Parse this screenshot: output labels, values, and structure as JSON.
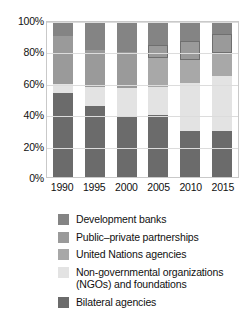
{
  "chart_data": {
    "type": "bar",
    "subtype": "stacked-percentage",
    "title": "",
    "subtitle": "",
    "xlabel": "",
    "ylabel": "",
    "categories": [
      "1990",
      "1995",
      "2000",
      "2005",
      "2010",
      "2015"
    ],
    "ylim": [
      0,
      100
    ],
    "yticks": [
      "0%",
      "20%",
      "40%",
      "60%",
      "80%",
      "100%"
    ],
    "ytick_values": [
      0,
      20,
      40,
      60,
      80,
      100
    ],
    "grid": true,
    "legend_position": "bottom",
    "stack_order_bottom_to_top": [
      "Bilateral agencies",
      "Non-governmental organizations (NGOs) and foundations",
      "United Nations agencies",
      "Public–private partnerships",
      "Development banks"
    ],
    "series": [
      {
        "name": "Bilateral agencies",
        "color": "#6b6b6b",
        "values": [
          54,
          46,
          38.5,
          40,
          29.5,
          30
        ]
      },
      {
        "name": "Non-governmental organizations (NGOs) and foundations",
        "color": "#e3e3e3",
        "values": [
          6,
          12,
          19,
          18,
          31,
          35
        ]
      },
      {
        "name": "United Nations agencies",
        "color": "#a8a8a8",
        "values": [
          0,
          0,
          0,
          19,
          15,
          15
        ]
      },
      {
        "name": "Public–private partnerships",
        "color": "#9a9a9a",
        "values": [
          31,
          24,
          23,
          8,
          12.5,
          12
        ]
      },
      {
        "name": "Development banks",
        "color": "#848484",
        "values": [
          9,
          18,
          19.5,
          15,
          12,
          8
        ]
      }
    ],
    "outlined_segments": [
      {
        "category": "2005",
        "series": "Public–private partnerships"
      },
      {
        "category": "2010",
        "series": "Public–private partnerships"
      },
      {
        "category": "2015",
        "series": "Public–private partnerships"
      }
    ]
  },
  "legend": {
    "items": [
      {
        "label": "Development banks",
        "color": "#848484"
      },
      {
        "label": "Public–private partnerships",
        "color": "#9a9a9a"
      },
      {
        "label": "United Nations agencies",
        "color": "#a8a8a8"
      },
      {
        "label": "Non-governmental organizations\n  (NGOs) and foundations",
        "color": "#e3e3e3"
      },
      {
        "label": "Bilateral agencies",
        "color": "#6b6b6b"
      }
    ]
  }
}
